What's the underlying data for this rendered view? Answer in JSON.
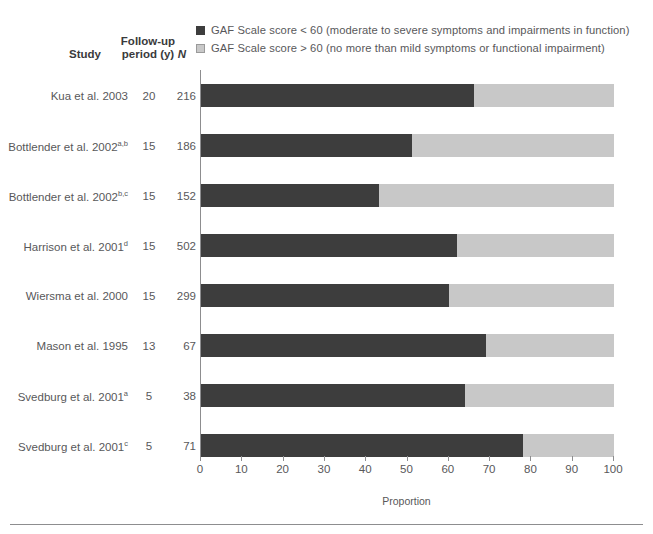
{
  "legend": [
    {
      "swatch": "dark",
      "label": "GAF Scale score < 60 (moderate to severe symptoms and impairments in function)"
    },
    {
      "swatch": "light",
      "label": "GAF Scale score > 60 (no more than mild symptoms or functional impairment)"
    }
  ],
  "headers": {
    "study": "Study",
    "follow_up_line1": "Follow-up",
    "follow_up_line2": "period (y)",
    "n": "N"
  },
  "colors": {
    "dark": "#3d3d3d",
    "light": "#c8c8c8",
    "axis": "#8d8d8f",
    "text": "#58585a"
  },
  "chart_data": {
    "type": "bar",
    "orientation": "horizontal",
    "stacked": true,
    "title": "",
    "xlabel": "Proportion",
    "ylabel": "",
    "xlim": [
      0,
      100
    ],
    "xticks": [
      0,
      10,
      20,
      30,
      40,
      50,
      60,
      70,
      80,
      90,
      100
    ],
    "grid": false,
    "legend_position": "top-right",
    "categories": [
      "Kua et al. 2003",
      "Bottlender et al. 2002a,b",
      "Bottlender et al. 2002b,c",
      "Harrison et al. 2001d",
      "Wiersma et al. 2000",
      "Mason et al. 1995",
      "Svedburg et al. 2001a",
      "Svedburg et al. 2001c"
    ],
    "series": [
      {
        "name": "GAF Scale score < 60 (moderate to severe symptoms and impairments in function)",
        "values": [
          66,
          51,
          43,
          62,
          60,
          69,
          64,
          78
        ]
      },
      {
        "name": "GAF Scale score > 60 (no more than mild symptoms or functional impairment)",
        "values": [
          34,
          49,
          57,
          38,
          40,
          31,
          36,
          22
        ]
      }
    ],
    "rows": [
      {
        "study": "Kua et al. 2003",
        "sup": "",
        "follow_up": "20",
        "n": "216",
        "dark": 66,
        "light": 34
      },
      {
        "study": "Bottlender et al. 2002",
        "sup": "a,b",
        "follow_up": "15",
        "n": "186",
        "dark": 51,
        "light": 49
      },
      {
        "study": "Bottlender et al. 2002",
        "sup": "b,c",
        "follow_up": "15",
        "n": "152",
        "dark": 43,
        "light": 57
      },
      {
        "study": "Harrison et al. 2001",
        "sup": "d",
        "follow_up": "15",
        "n": "502",
        "dark": 62,
        "light": 38
      },
      {
        "study": "Wiersma et al. 2000",
        "sup": "",
        "follow_up": "15",
        "n": "299",
        "dark": 60,
        "light": 40
      },
      {
        "study": "Mason et al. 1995",
        "sup": "",
        "follow_up": "13",
        "n": "67",
        "dark": 69,
        "light": 31
      },
      {
        "study": "Svedburg et al. 2001",
        "sup": "a",
        "follow_up": "5",
        "n": "38",
        "dark": 64,
        "light": 36
      },
      {
        "study": "Svedburg et al. 2001",
        "sup": "c",
        "follow_up": "5",
        "n": "71",
        "dark": 78,
        "light": 22
      }
    ]
  }
}
